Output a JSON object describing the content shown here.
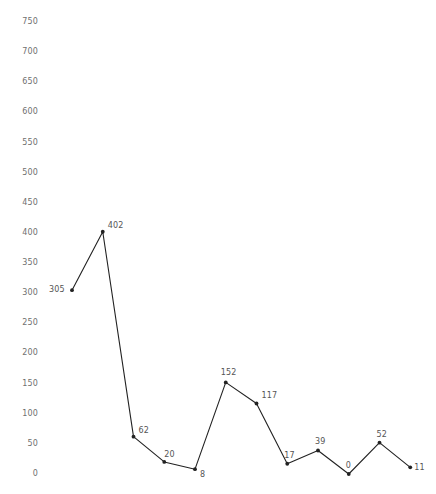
{
  "chart_data": {
    "type": "line",
    "title": "",
    "subtitle": "",
    "xlabel": "",
    "ylabel": "",
    "grid": false,
    "legend": "none",
    "x": [
      1,
      2,
      3,
      4,
      5,
      6,
      7,
      8,
      9,
      10,
      11,
      12
    ],
    "categories": [
      "1",
      "2",
      "3",
      "4",
      "5",
      "6",
      "7",
      "8",
      "9",
      "10",
      "11",
      "12"
    ],
    "values": [
      305,
      402,
      62,
      20,
      8,
      152,
      117,
      17,
      39,
      0,
      52,
      11
    ],
    "point_labels": [
      "305",
      "402",
      "62",
      "20",
      "8",
      "152",
      "117",
      "17",
      "39",
      "0",
      "52",
      "11"
    ],
    "ylim": [
      0,
      750
    ],
    "ytick_values": [
      750,
      700,
      650,
      600,
      550,
      500,
      450,
      400,
      350,
      300,
      250,
      200,
      150,
      100,
      50,
      0
    ],
    "ytick_labels": [
      "750",
      "700",
      "650",
      "600",
      "550",
      "500",
      "450",
      "400",
      "350",
      "300",
      "250",
      "200",
      "150",
      "100",
      "50",
      "0"
    ],
    "xtick_labels": [],
    "series_color": "#222222",
    "label_color": "#555555",
    "axis_label_color": "#6f6f6f",
    "background_color": "#ffffff",
    "marker": "dot",
    "label_offsets": [
      {
        "dx": -23,
        "dy": -4
      },
      {
        "dx": 5,
        "dy": -10
      },
      {
        "dx": 5,
        "dy": -10
      },
      {
        "dx": 0,
        "dy": -11
      },
      {
        "dx": 5,
        "dy": 2
      },
      {
        "dx": -5,
        "dy": -13
      },
      {
        "dx": 5,
        "dy": -11
      },
      {
        "dx": -3,
        "dy": -12
      },
      {
        "dx": -3,
        "dy": -12
      },
      {
        "dx": -3,
        "dy": -12
      },
      {
        "dx": -3,
        "dy": -12
      },
      {
        "dx": 4,
        "dy": -3
      }
    ]
  }
}
